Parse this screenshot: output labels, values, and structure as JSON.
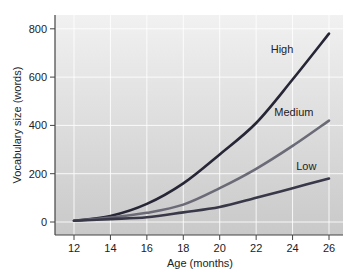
{
  "chart_data": {
    "type": "line",
    "title": "",
    "xlabel": "Age (months)",
    "ylabel": "Vocabulary size (words)",
    "x": [
      12,
      14,
      16,
      18,
      20,
      22,
      24,
      26
    ],
    "xticks": [
      12,
      14,
      16,
      18,
      20,
      22,
      24,
      26
    ],
    "yticks": [
      0,
      200,
      400,
      600,
      800
    ],
    "xlim": [
      11,
      26.8
    ],
    "ylim": [
      -55,
      850
    ],
    "grid": true,
    "legend_position": "inline labels at line ends",
    "series": [
      {
        "name": "High",
        "values": [
          5,
          25,
          75,
          160,
          280,
          410,
          590,
          780
        ],
        "color": "#262636",
        "label_pos": [
          22.8,
          700
        ]
      },
      {
        "name": "Medium",
        "values": [
          5,
          18,
          38,
          72,
          140,
          220,
          315,
          420
        ],
        "color": "#6b6b78",
        "label_pos": [
          23.0,
          440
        ]
      },
      {
        "name": "Low",
        "values": [
          5,
          12,
          20,
          40,
          62,
          100,
          140,
          180
        ],
        "color": "#383848",
        "label_pos": [
          24.2,
          215
        ]
      }
    ]
  },
  "colors": {
    "plot_bg_top": "#f1f1f1",
    "plot_bg_bottom": "#c9c9c9",
    "grid": "#ffffff",
    "axis": "#444444"
  }
}
